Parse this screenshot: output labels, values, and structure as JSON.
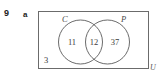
{
  "figure": {
    "question_number": "9",
    "part_label": "a",
    "type": "venn-diagram",
    "universe": {
      "label": "U",
      "outside_value": "3"
    },
    "sets": [
      {
        "id": "C",
        "label": "C",
        "only_value": "11"
      },
      {
        "id": "P",
        "label": "P",
        "only_value": "37"
      }
    ],
    "intersection_value": "12",
    "colors": {
      "stroke": "#5a5a5a",
      "rect_stroke": "#6b6b6b",
      "text": "#3d3d3d",
      "background": "#ffffff"
    }
  }
}
